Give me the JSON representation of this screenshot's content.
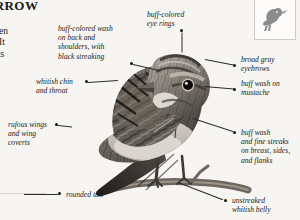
{
  "page": {
    "background_color": "#f7f5f1",
    "text_color": "#1c1c1c",
    "title": "SPARROW",
    "body_copy": "ogs and\ntish, often\nturbed. It\nuse of its\n the\nay\nies"
  },
  "thumbnail": {
    "name": "perched-sparrow-silhouette",
    "border_color": "#cfcbc4",
    "fill_color": "#8c8c8c"
  },
  "illustration": {
    "name": "lincolns-sparrow-illustration",
    "description": "Grayscale engraving of a streaked sparrow perched on a branch"
  },
  "callouts": [
    {
      "id": "back-shoulders",
      "text": "buff-colored wash\non back and\nshoulders, with\nblack streaking"
    },
    {
      "id": "chin-throat",
      "text": "whitish chin\nand throat"
    },
    {
      "id": "wings-coverts",
      "text": "rufous wings\nand wing\ncoverts"
    },
    {
      "id": "tail",
      "text": "rounded tail"
    },
    {
      "id": "eye-rings",
      "text": "buff-colored\neye rings"
    },
    {
      "id": "eyebrows",
      "text": "broad gray\neyebrows"
    },
    {
      "id": "mustache",
      "text": "buff wash on\nmustache"
    },
    {
      "id": "breast-sides-flanks",
      "text": "buff wash\nand fine streaks\non breast, sides,\nand flanks"
    },
    {
      "id": "belly",
      "text": "unstreaked\nwhitish belly"
    }
  ]
}
